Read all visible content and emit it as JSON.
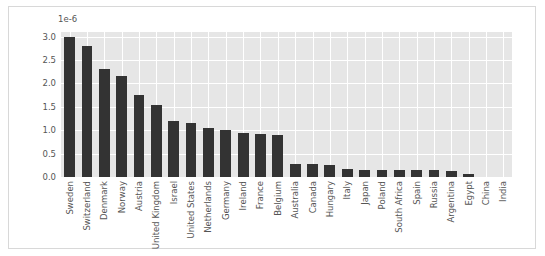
{
  "chart_data": {
    "type": "bar",
    "title": "",
    "xlabel": "",
    "ylabel": "",
    "y_offset_text": "1e-6",
    "ylim": [
      0,
      3.1
    ],
    "yticks": [
      "0.0",
      "0.5",
      "1.0",
      "1.5",
      "2.0",
      "2.5",
      "3.0"
    ],
    "ytick_values": [
      0.0,
      0.5,
      1.0,
      1.5,
      2.0,
      2.5,
      3.0
    ],
    "grid": true,
    "legend": "none",
    "bar_color": "#333333",
    "plot_background": "#e6e6e6",
    "grid_color": "#ffffff",
    "figure_background": "#ffffff",
    "tick_label_color": "#555555",
    "categories": [
      "Sweden",
      "Switzerland",
      "Denmark",
      "Norway",
      "Austria",
      "United Kingdom",
      "Israel",
      "United States",
      "Netherlands",
      "Germany",
      "Ireland",
      "France",
      "Belgium",
      "Australia",
      "Canada",
      "Hungary",
      "Italy",
      "Japan",
      "Poland",
      "South Africa",
      "Spain",
      "Russia",
      "Argentina",
      "Egypt",
      "China",
      "India"
    ],
    "values": [
      3.0,
      2.8,
      2.3,
      2.15,
      1.75,
      1.55,
      1.2,
      1.15,
      1.05,
      1.0,
      0.95,
      0.92,
      0.9,
      0.28,
      0.27,
      0.25,
      0.17,
      0.16,
      0.15,
      0.15,
      0.15,
      0.14,
      0.13,
      0.06,
      0.01,
      0.005
    ]
  }
}
